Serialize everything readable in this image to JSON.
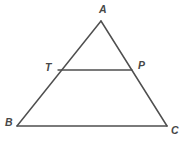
{
  "figure": {
    "kind": "geometry-diagram",
    "background_color": "#ffffff",
    "stroke_color": "#4f4f4f",
    "stroke_width": 1.5,
    "label_color": "#474747",
    "canvas": {
      "width": 187,
      "height": 143
    },
    "vertices": [
      {
        "id": "A",
        "label": "A",
        "x": 101,
        "y": 21,
        "label_x": 99,
        "label_y": 4
      },
      {
        "id": "B",
        "label": "B",
        "x": 17,
        "y": 126,
        "label_x": 5,
        "label_y": 117
      },
      {
        "id": "C",
        "label": "C",
        "x": 167,
        "y": 126,
        "label_x": 171,
        "label_y": 125
      },
      {
        "id": "T",
        "label": "T",
        "x": 58,
        "y": 70,
        "label_x": 45,
        "label_y": 62
      },
      {
        "id": "P",
        "label": "P",
        "x": 132,
        "y": 70,
        "label_x": 138,
        "label_y": 60
      }
    ],
    "segments": [
      {
        "id": "AB",
        "from": "A",
        "to": "B",
        "x1": 101,
        "y1": 21,
        "x2": 17,
        "y2": 126
      },
      {
        "id": "AC",
        "from": "A",
        "to": "C",
        "x1": 101,
        "y1": 21,
        "x2": 167,
        "y2": 126
      },
      {
        "id": "BC",
        "from": "B",
        "to": "C",
        "x1": 17,
        "y1": 126,
        "x2": 167,
        "y2": 126
      },
      {
        "id": "TP",
        "from": "T",
        "to": "P",
        "x1": 58,
        "y1": 70,
        "x2": 132,
        "y2": 70
      }
    ]
  }
}
